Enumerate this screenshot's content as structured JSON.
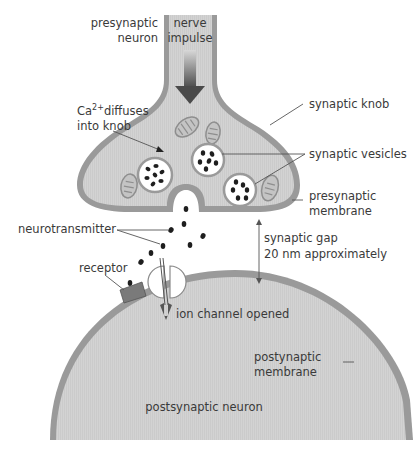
{
  "diagram": {
    "colors": {
      "cytoplasm": "#d2d2d2",
      "membrane": "#9a9a9a",
      "arrow": "#5a5a5a",
      "vesicle_fill": "#ffffff",
      "neurotransmitter": "#1e1e1e",
      "label": "#3a3a3a"
    },
    "labels": {
      "presynaptic_neuron_1": "presynaptic",
      "presynaptic_neuron_2": "neuron",
      "nerve_impulse_1": "nerve",
      "nerve_impulse_2": "impulse",
      "ca_prefix": "Ca",
      "ca_superscript": "2+",
      "ca_suffix": "diffuses",
      "ca_line2": "into knob",
      "synaptic_knob": "synaptic knob",
      "synaptic_vesicles": "synaptic vesicles",
      "presynaptic_membrane_1": "presynaptic",
      "presynaptic_membrane_2": "membrane",
      "neurotransmitter": "neurotransmitter",
      "synaptic_gap_1": "synaptic gap",
      "synaptic_gap_2": "20 nm approximately",
      "receptor": "receptor",
      "ion_channel": "ion channel opened",
      "postsynaptic_membrane_1": "postynaptic",
      "postsynaptic_membrane_2": "membrane",
      "postsynaptic_neuron": "postsynaptic neuron"
    }
  }
}
